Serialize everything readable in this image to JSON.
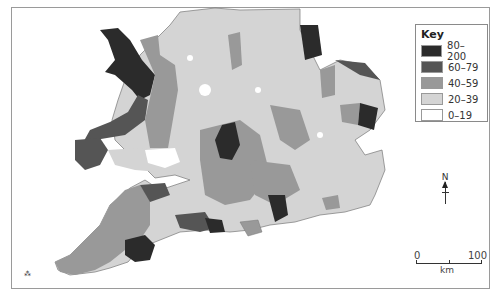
{
  "map": {
    "title": "",
    "region": "England and Wales"
  },
  "key": {
    "title": "Key",
    "items": [
      {
        "label": "80–200",
        "color": "#2b2b2b"
      },
      {
        "label": "60–79",
        "color": "#555555"
      },
      {
        "label": "40–59",
        "color": "#999999"
      },
      {
        "label": "20–39",
        "color": "#d4d4d4"
      },
      {
        "label": "0–19",
        "color": "#ffffff"
      }
    ]
  },
  "north_arrow": {
    "label": "N"
  },
  "scale_bar": {
    "start": "0",
    "end": "100",
    "unit": "km"
  }
}
